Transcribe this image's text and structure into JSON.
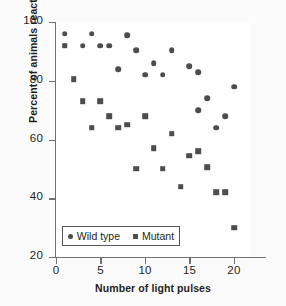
{
  "chart_data": {
    "type": "scatter",
    "title": "",
    "xlabel": "Number of light pulses",
    "ylabel": "Percent of animals reacting",
    "xlim": [
      0,
      21.8
    ],
    "ylim": [
      20,
      100
    ],
    "xticks": [
      0,
      5,
      10,
      15,
      20
    ],
    "yticks": [
      20,
      40,
      60,
      80,
      100
    ],
    "xtick_labels": [
      "0",
      "5",
      "10",
      "15",
      "20"
    ],
    "ytick_labels": [
      "20",
      "40",
      "60",
      "80",
      "100"
    ],
    "grid": false,
    "legend_position": "lower-left-inside",
    "series": [
      {
        "name": "Wild type",
        "marker": "circle",
        "color": "#4d4d4f",
        "points": [
          {
            "x": 1,
            "y": 96
          },
          {
            "x": 3,
            "y": 92
          },
          {
            "x": 4,
            "y": 96
          },
          {
            "x": 5,
            "y": 92
          },
          {
            "x": 6,
            "y": 92
          },
          {
            "x": 7,
            "y": 84
          },
          {
            "x": 8,
            "y": 95.5
          },
          {
            "x": 9,
            "y": 90.5
          },
          {
            "x": 10,
            "y": 82
          },
          {
            "x": 11,
            "y": 86
          },
          {
            "x": 12,
            "y": 82
          },
          {
            "x": 13,
            "y": 90.5
          },
          {
            "x": 15,
            "y": 85
          },
          {
            "x": 16,
            "y": 83
          },
          {
            "x": 16,
            "y": 70
          },
          {
            "x": 17,
            "y": 74
          },
          {
            "x": 18,
            "y": 64
          },
          {
            "x": 19,
            "y": 68
          },
          {
            "x": 20,
            "y": 78
          }
        ]
      },
      {
        "name": "Mutant",
        "marker": "square",
        "color": "#4d4d4f",
        "points": [
          {
            "x": 1,
            "y": 92
          },
          {
            "x": 2,
            "y": 80.5
          },
          {
            "x": 3,
            "y": 73
          },
          {
            "x": 4,
            "y": 64
          },
          {
            "x": 5,
            "y": 73
          },
          {
            "x": 6,
            "y": 68
          },
          {
            "x": 7,
            "y": 64
          },
          {
            "x": 8,
            "y": 65
          },
          {
            "x": 9,
            "y": 50
          },
          {
            "x": 10,
            "y": 68
          },
          {
            "x": 11,
            "y": 57
          },
          {
            "x": 12,
            "y": 50
          },
          {
            "x": 13,
            "y": 62
          },
          {
            "x": 14,
            "y": 44
          },
          {
            "x": 15,
            "y": 54.5
          },
          {
            "x": 16,
            "y": 56
          },
          {
            "x": 17,
            "y": 50.5
          },
          {
            "x": 18,
            "y": 42
          },
          {
            "x": 19,
            "y": 42
          },
          {
            "x": 20,
            "y": 30
          }
        ]
      }
    ]
  },
  "legend": {
    "entries": [
      {
        "label": "Wild type",
        "marker": "circle"
      },
      {
        "label": "Mutant",
        "marker": "square"
      }
    ]
  }
}
